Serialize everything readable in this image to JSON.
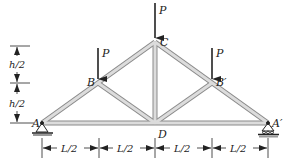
{
  "figure": {
    "type": "roof truss diagram",
    "colors": {
      "member_fill": "#dcdcdc",
      "member_edge": "#8a8a8a",
      "ink": "#222222"
    }
  },
  "nodes": {
    "A": {
      "label": "A",
      "x": 42,
      "y": 123
    },
    "B": {
      "label": "B",
      "x": 98,
      "y": 83
    },
    "C": {
      "label": "C",
      "x": 155,
      "y": 42
    },
    "D": {
      "label": "D",
      "x": 155,
      "y": 123
    },
    "Bp": {
      "label": "B′",
      "x": 212,
      "y": 83
    },
    "Ap": {
      "label": "A′",
      "x": 268,
      "y": 123
    }
  },
  "loads": [
    {
      "label": "P",
      "node": "B"
    },
    {
      "label": "P",
      "node": "C"
    },
    {
      "label": "P",
      "node": "Bp"
    }
  ],
  "supports": [
    {
      "node": "A",
      "type": "pin"
    },
    {
      "node": "Ap",
      "type": "roller"
    }
  ],
  "dimensions": {
    "vertical": [
      "h/2",
      "h/2"
    ],
    "horizontal": [
      "L/2",
      "L/2",
      "L/2",
      "L/2"
    ]
  }
}
